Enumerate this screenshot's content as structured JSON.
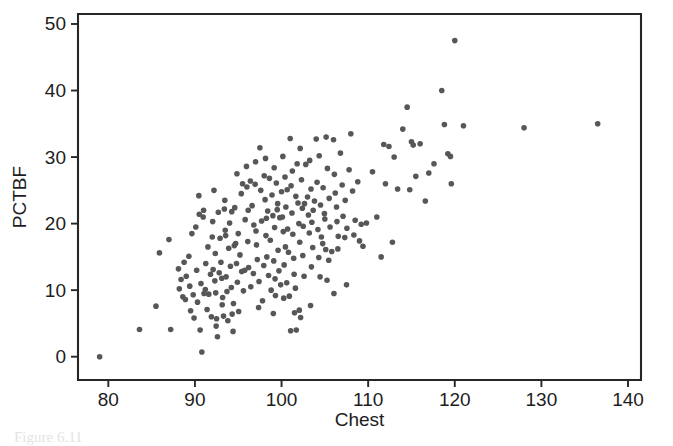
{
  "figure": {
    "caption": "Figure 6.11",
    "background_color": "#ffffff"
  },
  "chart_data": {
    "type": "scatter",
    "title": "",
    "xlabel": "Chest",
    "ylabel": "PCTBF",
    "xlim": [
      76.5,
      141.5
    ],
    "ylim": [
      -3.5,
      51.5
    ],
    "xticks": [
      80,
      90,
      100,
      110,
      120,
      130,
      140
    ],
    "yticks": [
      0,
      10,
      20,
      30,
      40,
      50
    ],
    "grid": false,
    "legend": null,
    "marker": {
      "shape": "circle",
      "color": "#575757",
      "size_px": 5.6
    },
    "frame": {
      "left_px": 78,
      "right_px": 641,
      "top_px": 14,
      "bottom_px": 380,
      "style": "box"
    },
    "n_points": 251,
    "points": [
      [
        79.0,
        0.0
      ],
      [
        83.6,
        4.1
      ],
      [
        85.9,
        15.6
      ],
      [
        85.5,
        7.6
      ],
      [
        87.0,
        17.6
      ],
      [
        87.2,
        4.1
      ],
      [
        88.1,
        13.2
      ],
      [
        88.4,
        11.6
      ],
      [
        88.2,
        10.2
      ],
      [
        88.6,
        9.0
      ],
      [
        88.9,
        8.6
      ],
      [
        89.0,
        12.1
      ],
      [
        89.3,
        15.1
      ],
      [
        89.4,
        10.6
      ],
      [
        89.5,
        6.9
      ],
      [
        89.8,
        9.3
      ],
      [
        89.9,
        5.8
      ],
      [
        90.2,
        13.0
      ],
      [
        90.3,
        8.2
      ],
      [
        90.5,
        21.4
      ],
      [
        90.6,
        4.0
      ],
      [
        90.7,
        11.0
      ],
      [
        90.8,
        0.7
      ],
      [
        91.0,
        22.0
      ],
      [
        91.2,
        10.1
      ],
      [
        91.4,
        7.1
      ],
      [
        91.6,
        9.4
      ],
      [
        91.8,
        12.4
      ],
      [
        91.9,
        6.0
      ],
      [
        92.0,
        18.0
      ],
      [
        92.1,
        13.1
      ],
      [
        92.3,
        11.4
      ],
      [
        92.4,
        9.6
      ],
      [
        92.5,
        5.7
      ],
      [
        92.6,
        3.0
      ],
      [
        92.7,
        21.7
      ],
      [
        92.8,
        12.6
      ],
      [
        92.9,
        17.8
      ],
      [
        93.0,
        14.2
      ],
      [
        93.1,
        11.8
      ],
      [
        93.2,
        8.9
      ],
      [
        93.3,
        6.1
      ],
      [
        93.4,
        22.2
      ],
      [
        93.5,
        19.0
      ],
      [
        93.6,
        12.0
      ],
      [
        93.7,
        9.8
      ],
      [
        93.8,
        5.4
      ],
      [
        93.9,
        16.3
      ],
      [
        94.0,
        20.1
      ],
      [
        94.1,
        13.6
      ],
      [
        94.2,
        10.4
      ],
      [
        94.3,
        6.4
      ],
      [
        94.4,
        3.8
      ],
      [
        94.6,
        22.4
      ],
      [
        94.7,
        17.0
      ],
      [
        94.8,
        14.0
      ],
      [
        94.9,
        11.2
      ],
      [
        95.0,
        18.5
      ],
      [
        95.2,
        15.3
      ],
      [
        95.4,
        12.8
      ],
      [
        95.5,
        26.0
      ],
      [
        95.6,
        9.9
      ],
      [
        95.8,
        20.6
      ],
      [
        96.0,
        25.5
      ],
      [
        96.1,
        17.3
      ],
      [
        96.2,
        13.4
      ],
      [
        96.4,
        26.4
      ],
      [
        96.6,
        22.7
      ],
      [
        96.8,
        19.8
      ],
      [
        97.0,
        29.3
      ],
      [
        97.1,
        16.8
      ],
      [
        97.2,
        14.6
      ],
      [
        97.4,
        11.3
      ],
      [
        97.5,
        31.4
      ],
      [
        97.6,
        25.0
      ],
      [
        97.7,
        20.4
      ],
      [
        97.8,
        8.4
      ],
      [
        98.0,
        27.2
      ],
      [
        98.1,
        23.6
      ],
      [
        98.2,
        18.2
      ],
      [
        98.3,
        15.0
      ],
      [
        98.4,
        21.9
      ],
      [
        98.5,
        12.2
      ],
      [
        98.6,
        26.8
      ],
      [
        98.7,
        17.5
      ],
      [
        98.8,
        10.0
      ],
      [
        98.9,
        24.3
      ],
      [
        99.0,
        21.2
      ],
      [
        99.1,
        14.4
      ],
      [
        99.2,
        19.4
      ],
      [
        99.3,
        9.2
      ],
      [
        99.4,
        26.1
      ],
      [
        99.5,
        22.1
      ],
      [
        99.6,
        16.0
      ],
      [
        99.7,
        12.9
      ],
      [
        99.8,
        20.9
      ],
      [
        99.9,
        10.8
      ],
      [
        100.0,
        24.8
      ],
      [
        100.1,
        21.0
      ],
      [
        100.2,
        18.8
      ],
      [
        100.3,
        13.8
      ],
      [
        100.4,
        27.0
      ],
      [
        100.5,
        22.5
      ],
      [
        100.6,
        11.1
      ],
      [
        100.7,
        19.2
      ],
      [
        100.8,
        15.7
      ],
      [
        100.9,
        9.1
      ],
      [
        101.0,
        32.8
      ],
      [
        101.1,
        25.7
      ],
      [
        101.2,
        21.6
      ],
      [
        101.3,
        18.4
      ],
      [
        101.4,
        14.8
      ],
      [
        101.5,
        6.6
      ],
      [
        101.6,
        10.3
      ],
      [
        101.7,
        4.0
      ],
      [
        101.8,
        29.0
      ],
      [
        101.9,
        23.1
      ],
      [
        102.0,
        20.0
      ],
      [
        102.1,
        17.2
      ],
      [
        102.2,
        5.9
      ],
      [
        102.3,
        26.6
      ],
      [
        102.4,
        22.3
      ],
      [
        102.5,
        19.6
      ],
      [
        102.6,
        12.1
      ],
      [
        102.8,
        28.9
      ],
      [
        103.0,
        24.0
      ],
      [
        103.1,
        21.3
      ],
      [
        103.2,
        18.6
      ],
      [
        103.4,
        25.2
      ],
      [
        103.5,
        20.2
      ],
      [
        103.6,
        16.4
      ],
      [
        103.8,
        23.4
      ],
      [
        104.0,
        32.7
      ],
      [
        104.1,
        26.2
      ],
      [
        104.2,
        19.1
      ],
      [
        104.3,
        14.9
      ],
      [
        104.5,
        22.8
      ],
      [
        104.6,
        18.0
      ],
      [
        104.8,
        25.4
      ],
      [
        105.0,
        20.7
      ],
      [
        105.1,
        16.1
      ],
      [
        105.3,
        28.3
      ],
      [
        105.5,
        23.8
      ],
      [
        105.6,
        19.5
      ],
      [
        105.8,
        15.8
      ],
      [
        106.0,
        32.6
      ],
      [
        106.1,
        27.4
      ],
      [
        106.2,
        24.6
      ],
      [
        106.4,
        20.3
      ],
      [
        106.5,
        16.2
      ],
      [
        106.8,
        30.6
      ],
      [
        107.0,
        25.8
      ],
      [
        107.1,
        21.1
      ],
      [
        107.3,
        17.9
      ],
      [
        107.5,
        10.8
      ],
      [
        107.8,
        28.1
      ],
      [
        108.0,
        33.5
      ],
      [
        108.2,
        24.9
      ],
      [
        108.5,
        20.5
      ],
      [
        108.8,
        26.3
      ],
      [
        109.0,
        17.4
      ],
      [
        109.2,
        19.9
      ],
      [
        109.4,
        16.6
      ],
      [
        109.8,
        20.1
      ],
      [
        110.5,
        27.8
      ],
      [
        111.0,
        21.0
      ],
      [
        111.5,
        15.0
      ],
      [
        111.8,
        31.9
      ],
      [
        112.0,
        26.0
      ],
      [
        112.4,
        31.6
      ],
      [
        112.8,
        17.2
      ],
      [
        113.0,
        30.0
      ],
      [
        113.4,
        25.2
      ],
      [
        114.0,
        34.2
      ],
      [
        114.5,
        37.5
      ],
      [
        114.8,
        25.1
      ],
      [
        115.0,
        32.3
      ],
      [
        115.2,
        31.8
      ],
      [
        115.5,
        27.1
      ],
      [
        116.0,
        32.0
      ],
      [
        116.6,
        23.4
      ],
      [
        117.0,
        27.6
      ],
      [
        117.6,
        29.0
      ],
      [
        118.5,
        40.0
      ],
      [
        118.8,
        34.9
      ],
      [
        119.2,
        30.5
      ],
      [
        119.5,
        30.1
      ],
      [
        119.6,
        26.0
      ],
      [
        120.0,
        47.5
      ],
      [
        121.0,
        34.7
      ],
      [
        128.0,
        34.4
      ],
      [
        136.5,
        35.0
      ],
      [
        90.1,
        19.5
      ],
      [
        91.5,
        16.5
      ],
      [
        92.2,
        25.0
      ],
      [
        93.15,
        7.8
      ],
      [
        94.45,
        8.0
      ],
      [
        95.05,
        6.8
      ],
      [
        96.45,
        10.5
      ],
      [
        97.35,
        7.4
      ],
      [
        99.05,
        6.5
      ],
      [
        100.25,
        8.8
      ],
      [
        101.05,
        3.9
      ],
      [
        102.05,
        7.0
      ],
      [
        103.35,
        7.7
      ],
      [
        104.45,
        12.0
      ],
      [
        105.25,
        11.5
      ],
      [
        106.05,
        9.5
      ],
      [
        88.75,
        14.2
      ],
      [
        89.65,
        18.5
      ],
      [
        90.95,
        21.0
      ],
      [
        92.05,
        20.3
      ],
      [
        93.45,
        23.5
      ],
      [
        94.25,
        21.8
      ],
      [
        95.35,
        24.5
      ],
      [
        96.15,
        22.0
      ],
      [
        97.05,
        18.9
      ],
      [
        98.15,
        29.8
      ],
      [
        99.15,
        28.4
      ],
      [
        100.15,
        30.1
      ],
      [
        101.25,
        27.9
      ],
      [
        102.15,
        31.3
      ],
      [
        103.25,
        29.5
      ],
      [
        104.35,
        30.2
      ],
      [
        105.15,
        33.0
      ],
      [
        106.35,
        22.5
      ],
      [
        107.35,
        23.5
      ],
      [
        108.35,
        18.3
      ],
      [
        90.45,
        24.2
      ],
      [
        91.25,
        14.0
      ],
      [
        92.35,
        15.5
      ],
      [
        93.55,
        18.2
      ],
      [
        94.55,
        16.7
      ],
      [
        95.75,
        13.0
      ],
      [
        96.75,
        12.5
      ],
      [
        97.95,
        13.7
      ],
      [
        99.25,
        11.7
      ],
      [
        100.45,
        16.5
      ],
      [
        101.45,
        12.4
      ],
      [
        102.45,
        15.2
      ],
      [
        103.45,
        13.5
      ],
      [
        104.75,
        17.0
      ],
      [
        105.45,
        14.5
      ],
      [
        98.25,
        20.8
      ],
      [
        99.55,
        23.0
      ],
      [
        100.65,
        25.1
      ],
      [
        101.65,
        24.1
      ],
      [
        102.65,
        23.0
      ],
      [
        103.65,
        22.0
      ],
      [
        104.95,
        21.5
      ],
      [
        106.55,
        18.1
      ],
      [
        107.55,
        19.3
      ],
      [
        94.85,
        27.5
      ],
      [
        95.95,
        28.6
      ],
      [
        96.95,
        25.9
      ],
      [
        91.05,
        9.5
      ],
      [
        92.45,
        4.6
      ]
    ]
  }
}
